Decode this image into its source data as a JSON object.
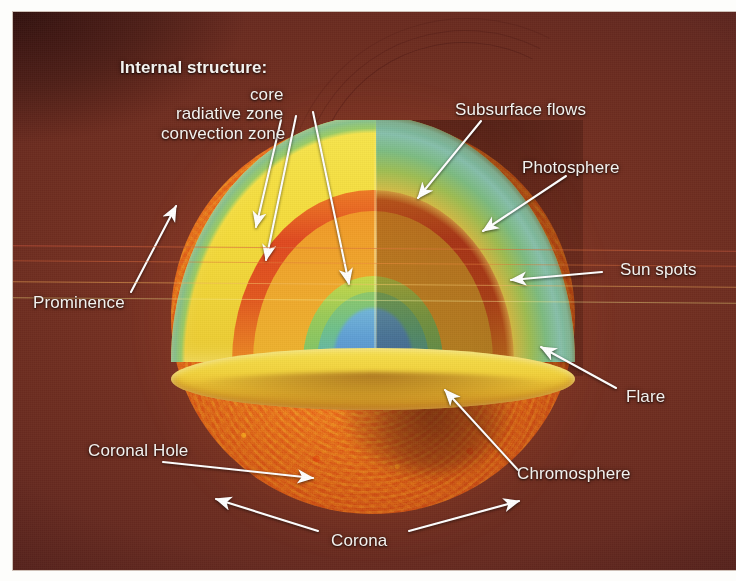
{
  "figure": {
    "kind": "annotated-photograph",
    "frame_color": "#ffffff",
    "background_color": "#6d2d20"
  },
  "title": {
    "internal_structure": "Internal structure:"
  },
  "internal_layers": [
    {
      "id": "core",
      "label": "core"
    },
    {
      "id": "radiative-zone",
      "label": "radiative zone"
    },
    {
      "id": "convection-zone",
      "label": "convection zone"
    }
  ],
  "labels": [
    {
      "id": "subsurface-flows",
      "label": "Subsurface flows"
    },
    {
      "id": "photosphere",
      "label": "Photosphere"
    },
    {
      "id": "sun-spots",
      "label": "Sun spots"
    },
    {
      "id": "flare",
      "label": "Flare"
    },
    {
      "id": "chromosphere",
      "label": "Chromosphere"
    },
    {
      "id": "corona",
      "label": "Corona"
    },
    {
      "id": "coronal-hole",
      "label": "Coronal Hole"
    },
    {
      "id": "prominence",
      "label": "Prominence"
    }
  ],
  "palette": {
    "convection_zone": "#f5dc3c",
    "radiative_zone": "#e04a20",
    "core_inner": "#5f9fd4",
    "core_mid": "#7cc46a",
    "photosphere": "#e8801f",
    "background": "#6d2d20",
    "label_text": "#f3f1ee",
    "arrow": "#ffffff"
  }
}
